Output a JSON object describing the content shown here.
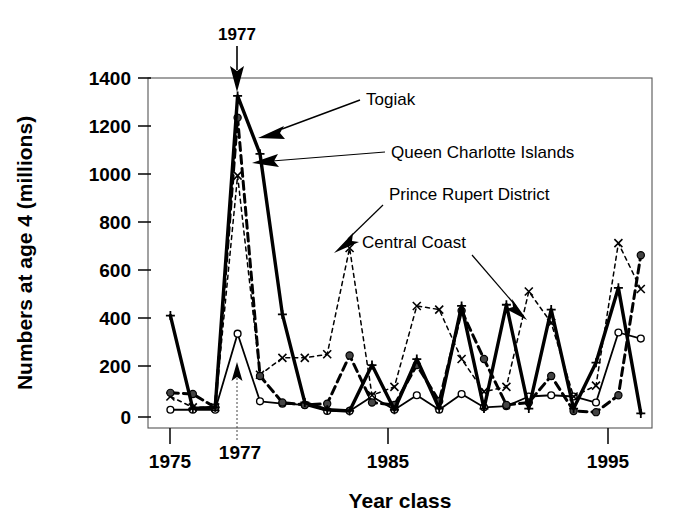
{
  "chart_data": {
    "type": "line",
    "title": "",
    "xlabel": "Year class",
    "ylabel": "Numbers at age 4  (millions)",
    "xlim": [
      1974,
      1996.5
    ],
    "ylim": [
      0,
      1400
    ],
    "xticks": [
      1975,
      1985,
      1995
    ],
    "xtick_labels": [
      "1975",
      "1985",
      "1995"
    ],
    "yticks": [
      0,
      200,
      400,
      600,
      800,
      1000,
      1200,
      1400
    ],
    "ytick_labels": [
      "0",
      "200",
      "400",
      "600",
      "800",
      "1000",
      "1200",
      "1400"
    ],
    "grid": false,
    "legend_position": "in-plot-annotations",
    "x": [
      1975,
      1976,
      1977,
      1978,
      1979,
      1980,
      1981,
      1982,
      1983,
      1984,
      1985,
      1986,
      1987,
      1988,
      1989,
      1990,
      1991,
      1992,
      1993,
      1994,
      1995,
      1996
    ],
    "series": [
      {
        "name": "Togiak",
        "style": "solid-thick",
        "marker": "plus",
        "color": "#000000",
        "values": [
          420,
          35,
          40,
          1330,
          1090,
          425,
          60,
          30,
          25,
          215,
          30,
          240,
          35,
          460,
          35,
          465,
          35,
          445,
          35,
          225,
          535,
          15
        ]
      },
      {
        "name": "Queen Charlotte Islands",
        "style": "dashed-thick",
        "marker": "filled-circle",
        "color": "#000000",
        "values": [
          100,
          95,
          40,
          1240,
          170,
          60,
          50,
          55,
          255,
          60,
          50,
          215,
          65,
          440,
          240,
          50,
          60,
          170,
          25,
          20,
          90,
          670
        ]
      },
      {
        "name": "Prince Rupert District",
        "style": "dotted-thin",
        "marker": "x",
        "color": "#000000",
        "values": [
          85,
          40,
          40,
          1000,
          175,
          245,
          245,
          260,
          700,
          90,
          125,
          460,
          445,
          240,
          105,
          125,
          520,
          390,
          85,
          130,
          720,
          530
        ]
      },
      {
        "name": "Central Coast",
        "style": "solid-thin",
        "marker": "open-circle",
        "color": "#000000",
        "values": [
          30,
          30,
          30,
          345,
          65,
          55,
          50,
          25,
          25,
          85,
          30,
          90,
          30,
          95,
          40,
          45,
          85,
          90,
          85,
          60,
          350,
          325
        ]
      }
    ],
    "annotations": [
      {
        "text": "Togiak",
        "target_year": 1978.7,
        "target_value": 1205
      },
      {
        "text": "Queen Charlotte Islands",
        "target_year": 1978.4,
        "target_value": 1095
      },
      {
        "text": "Prince Rupert District",
        "target_year": 1982.8,
        "target_value": 720
      },
      {
        "text": "Central Coast",
        "target_year": 1988.6,
        "target_value": 415
      },
      {
        "text": "1977",
        "target_year": 1978,
        "target_value": 1400,
        "kind": "event-marker"
      }
    ]
  },
  "axes": {
    "y_title": "Numbers at age 4  (millions)",
    "x_title": "Year class",
    "x_tick_1975": "1975",
    "x_tick_1985": "1985",
    "x_tick_1995": "1995",
    "x_event_tick": "1977",
    "y_tick_0": "0",
    "y_tick_200": "200",
    "y_tick_400": "400",
    "y_tick_600": "600",
    "y_tick_800": "800",
    "y_tick_1000": "1000",
    "y_tick_1200": "1200",
    "y_tick_1400": "1400"
  },
  "labels": {
    "togiak": "Togiak",
    "queen_charlotte": "Queen Charlotte Islands",
    "prince_rupert": "Prince Rupert District",
    "central_coast": "Central Coast",
    "event_top": "1977"
  },
  "colors": {
    "ink": "#000000",
    "background": "#ffffff"
  }
}
